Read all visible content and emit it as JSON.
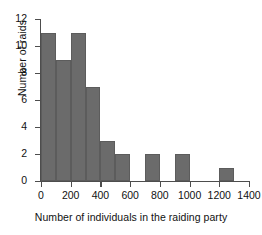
{
  "chart_data": {
    "type": "bar",
    "subtype": "histogram",
    "title": "",
    "xlabel": "Number of individuals in the raiding party",
    "ylabel": "Number of raids",
    "xlim": [
      0,
      1400
    ],
    "ylim": [
      0,
      12
    ],
    "bin_width": 100,
    "grid": false,
    "legend": null,
    "bar_color": "#6b6b6b",
    "axis_color": "#4d4d4d",
    "xticks": [
      0,
      200,
      400,
      600,
      800,
      1000,
      1200,
      1400
    ],
    "xticklabels": [
      "0",
      "200",
      "400",
      "600",
      "800",
      "1000",
      "1200",
      "1400"
    ],
    "yticks": [
      0,
      2,
      4,
      6,
      8,
      10,
      12
    ],
    "yticklabels": [
      "0",
      "2",
      "4",
      "6",
      "8",
      "10",
      "12"
    ],
    "categories": [
      "0-100",
      "100-200",
      "200-300",
      "300-400",
      "400-500",
      "500-600",
      "600-700",
      "700-800",
      "800-900",
      "900-1000",
      "1000-1100",
      "1100-1200",
      "1200-1300",
      "1300-1400"
    ],
    "bin_starts": [
      0,
      100,
      200,
      300,
      400,
      500,
      600,
      700,
      800,
      900,
      1000,
      1100,
      1200,
      1300
    ],
    "values": [
      11,
      9,
      11,
      7,
      3,
      2,
      0,
      2,
      0,
      2,
      0,
      0,
      1,
      0
    ]
  }
}
